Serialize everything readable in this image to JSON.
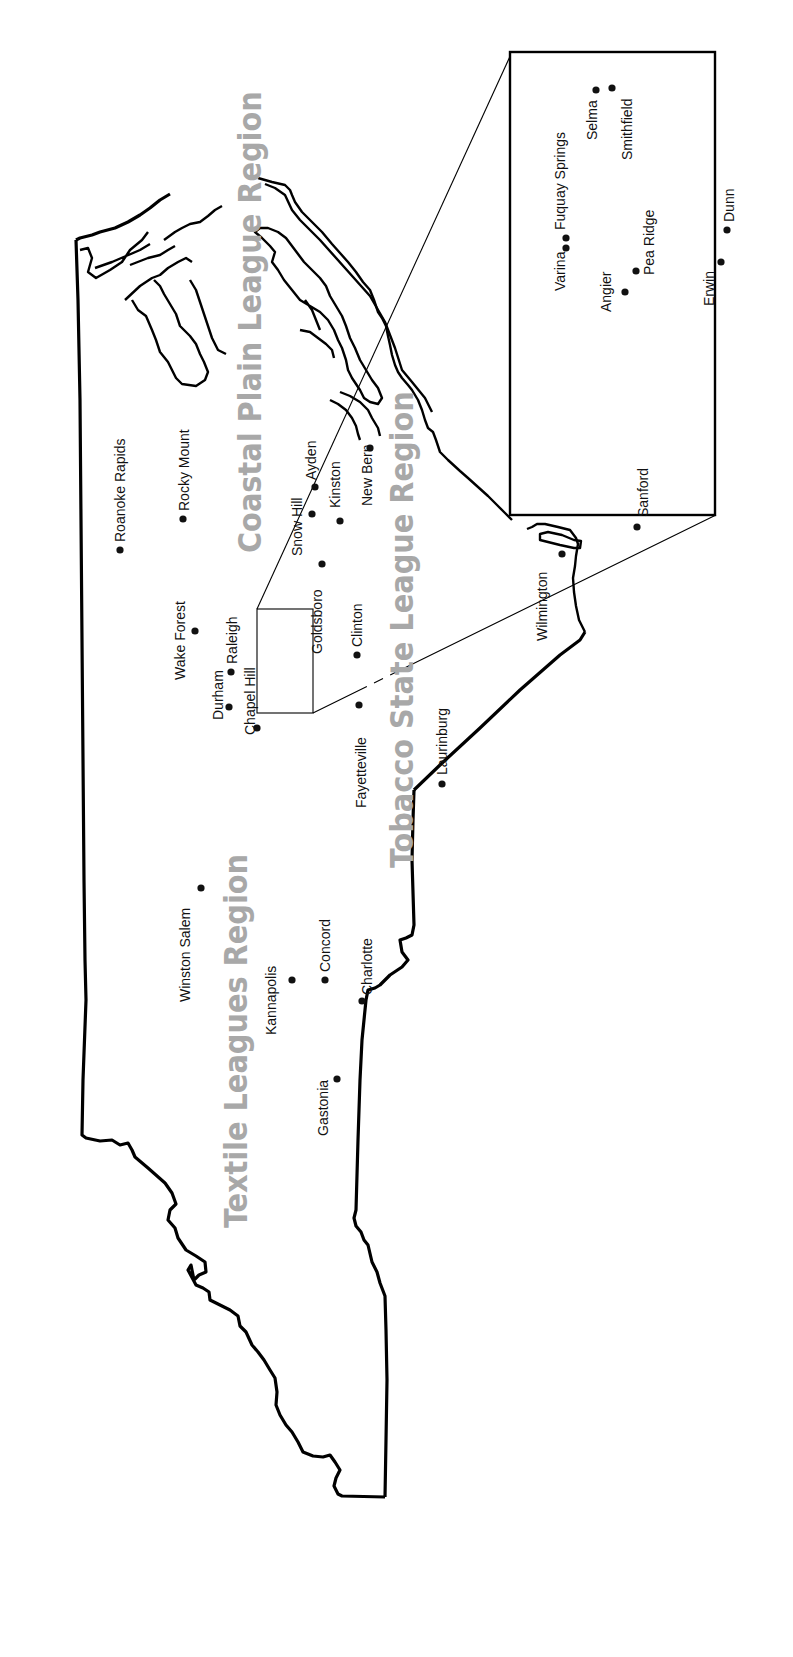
{
  "map": {
    "title": "North Carolina baseball league regions",
    "orientation": "rotated 90deg counter-clockwise",
    "regions": [
      {
        "id": "coastal",
        "label": "Coastal Plain League Region"
      },
      {
        "id": "tobacco",
        "label": "Tobacco State League Region"
      },
      {
        "id": "textile",
        "label": "Textile Leagues Region"
      }
    ],
    "cities": [
      {
        "name": "Roanoke Rapids"
      },
      {
        "name": "Rocky Mount"
      },
      {
        "name": "Wake Forest"
      },
      {
        "name": "Raleigh"
      },
      {
        "name": "Durham"
      },
      {
        "name": "Chapel Hill"
      },
      {
        "name": "Snow Hill"
      },
      {
        "name": "Ayden"
      },
      {
        "name": "Kinston"
      },
      {
        "name": "New Bern"
      },
      {
        "name": "Goldsboro"
      },
      {
        "name": "Clinton"
      },
      {
        "name": "Fayetteville"
      },
      {
        "name": "Laurinburg"
      },
      {
        "name": "Wilmington"
      },
      {
        "name": "Winston Salem"
      },
      {
        "name": "Kannapolis"
      },
      {
        "name": "Concord"
      },
      {
        "name": "Charlotte"
      },
      {
        "name": "Gastonia"
      }
    ],
    "inset": {
      "cities": [
        {
          "name": "Varina"
        },
        {
          "name": "Fuquay Springs"
        },
        {
          "name": "Selma"
        },
        {
          "name": "Smithfield"
        },
        {
          "name": "Angier"
        },
        {
          "name": "Pea Ridge"
        },
        {
          "name": "Sanford"
        },
        {
          "name": "Erwin"
        },
        {
          "name": "Dunn"
        }
      ]
    }
  }
}
